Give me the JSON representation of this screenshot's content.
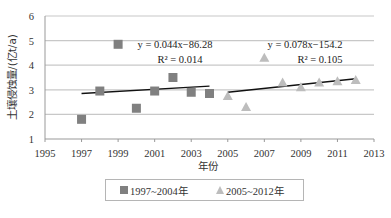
{
  "chart_data": {
    "type": "scatter",
    "title": "",
    "xlabel": "年份",
    "ylabel": "土壤侵蚀量/(亿t/a)",
    "xlim": [
      1995,
      2013
    ],
    "ylim": [
      1,
      6
    ],
    "xticks": [
      "1995",
      "1997",
      "1999",
      "2001",
      "2003",
      "2005",
      "2007",
      "2009",
      "2011",
      "2013"
    ],
    "yticks": [
      "1",
      "2",
      "3",
      "4",
      "5",
      "6"
    ],
    "grid": "horizontal",
    "legend_position": "bottom",
    "series": [
      {
        "name": "1997~2004年",
        "marker": "square",
        "color": "#808080",
        "x": [
          1997,
          1998,
          1999,
          2000,
          2001,
          2002,
          2003,
          2004
        ],
        "values": [
          1.8,
          2.95,
          4.85,
          2.25,
          2.95,
          3.5,
          2.9,
          2.85
        ],
        "trendline": {
          "equation": "y = 0.044x−86.28",
          "r2": "R² = 0.014",
          "start": [
            1997,
            2.85
          ],
          "end": [
            2004,
            3.15
          ]
        }
      },
      {
        "name": "2005~2012年",
        "marker": "triangle",
        "color": "#bdbdbd",
        "x": [
          2005,
          2006,
          2007,
          2008,
          2009,
          2010,
          2011,
          2012
        ],
        "values": [
          2.75,
          2.3,
          4.3,
          3.3,
          3.1,
          3.3,
          3.35,
          3.4
        ],
        "trendline": {
          "equation": "y = 0.078x−154.2",
          "r2": "R² = 0.105",
          "start": [
            2005,
            2.9
          ],
          "end": [
            2012,
            3.45
          ]
        }
      }
    ]
  },
  "legend": {
    "series1_label": "1997~2004年",
    "series2_label": "2005~2012年"
  }
}
